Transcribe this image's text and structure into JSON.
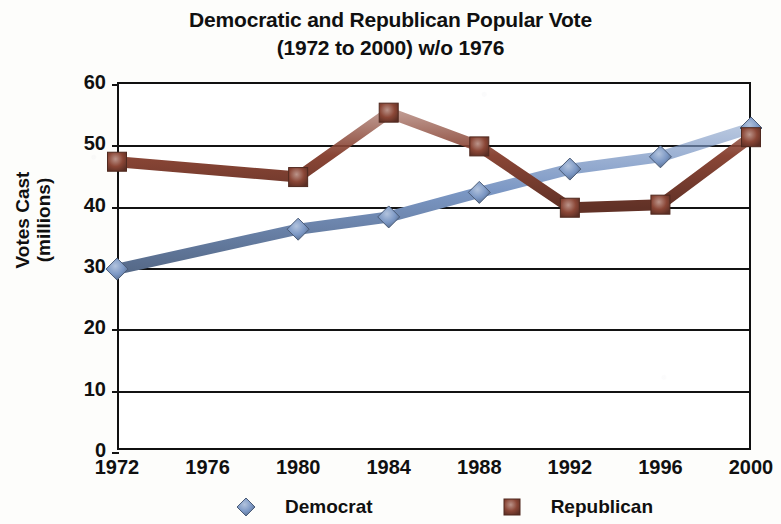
{
  "chart_data": {
    "type": "line",
    "title": "Democratic and Republican Popular Vote",
    "subtitle": "(1972 to 2000) w/o 1976",
    "xlabel": "",
    "ylabel": "Votes Cast (millions)",
    "categories": [
      "1972",
      "1976",
      "1980",
      "1984",
      "1988",
      "1992",
      "1996",
      "2000"
    ],
    "ylim": [
      0,
      60
    ],
    "ytick_labels": [
      "0",
      "10",
      "20",
      "30",
      "40",
      "50",
      "60"
    ],
    "ytick_values": [
      0,
      10,
      20,
      30,
      40,
      50,
      60
    ],
    "grid": true,
    "legend_position": "bottom",
    "series": [
      {
        "name": "Democrat",
        "color": "#7b97c4",
        "marker": "diamond",
        "values": [
          29.5,
          null,
          36.0,
          38.0,
          42.0,
          45.8,
          47.8,
          52.5
        ]
      },
      {
        "name": "Republican",
        "color": "#8a4636",
        "marker": "square",
        "values": [
          47.0,
          null,
          44.5,
          55.0,
          49.5,
          39.5,
          40.0,
          51.0
        ]
      }
    ],
    "note": "1976 has no plotted data; the lines skip that category"
  },
  "colors": {
    "democrat": "#7b97c4",
    "democrat_dark": "#5d7cab",
    "republican": "#8a4636",
    "republican_dark": "#6e3428",
    "axis": "#131313",
    "text": "#101010",
    "background": "#fdfdfb",
    "plot_background": "#ffffff"
  },
  "legend": {
    "items": [
      {
        "label": "Democrat",
        "icon": "blue-diamond-marker"
      },
      {
        "label": "Republican",
        "icon": "brown-square-marker"
      }
    ]
  },
  "axis_titles": {
    "y_line1": "Votes Cast",
    "y_line2": "(millions)"
  }
}
